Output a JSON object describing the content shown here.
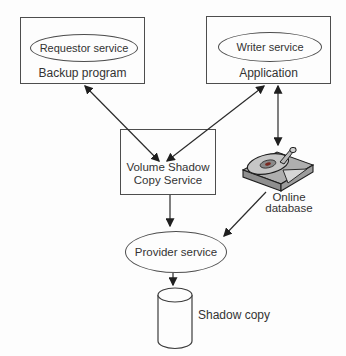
{
  "diagram": {
    "backup_box": {
      "service": "Requestor service",
      "label": "Backup program"
    },
    "application_box": {
      "service": "Writer service",
      "label": "Application"
    },
    "vss_box": {
      "line1": "Volume Shadow",
      "line2": "Copy Service"
    },
    "online_database": {
      "line1": "Online",
      "line2": "database"
    },
    "provider": {
      "label": "Provider service"
    },
    "shadow_copy": {
      "label": "Shadow copy"
    },
    "edges": [
      {
        "from": "backup-program-box",
        "to": "volume-shadow-copy-service-box",
        "direction": "both"
      },
      {
        "from": "application-box",
        "to": "volume-shadow-copy-service-box",
        "direction": "both"
      },
      {
        "from": "application-box",
        "to": "online-database",
        "direction": "both"
      },
      {
        "from": "volume-shadow-copy-service-box",
        "to": "provider-service",
        "direction": "to"
      },
      {
        "from": "online-database",
        "to": "provider-service",
        "direction": "to"
      },
      {
        "from": "provider-service",
        "to": "shadow-copy",
        "direction": "to"
      }
    ],
    "colors": {
      "background": "#fdfdfd",
      "line": "#2b2b2b",
      "border": "#4d4d4d",
      "text": "#333333",
      "disk_top": "#aeaeae",
      "disk_side": "#8f8f8f",
      "platter": "#c6c6c6",
      "hub_accent": "#7a2a22"
    }
  }
}
